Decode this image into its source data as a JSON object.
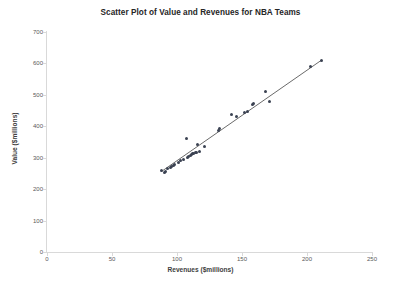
{
  "chart_data": {
    "type": "scatter",
    "title": "Scatter Plot of Value and Revenues for NBA Teams",
    "xlabel": "Revenues ($millions)",
    "ylabel": "Value ($millions)",
    "xlim": [
      0,
      250
    ],
    "ylim": [
      0,
      700
    ],
    "xticks": [
      0,
      50,
      100,
      150,
      200,
      250
    ],
    "yticks": [
      0,
      100,
      200,
      300,
      400,
      500,
      600,
      700
    ],
    "grid": false,
    "legend": false,
    "marker_color": "#3b4252",
    "trendline_color": "#595959",
    "trendline": {
      "visible": true,
      "x_start": 88,
      "y_start": 256,
      "x_end": 211,
      "y_end": 610
    },
    "points": [
      {
        "x": 88,
        "y": 258
      },
      {
        "x": 90,
        "y": 253
      },
      {
        "x": 91,
        "y": 256
      },
      {
        "x": 93,
        "y": 266
      },
      {
        "x": 95,
        "y": 268
      },
      {
        "x": 96,
        "y": 272
      },
      {
        "x": 97,
        "y": 275
      },
      {
        "x": 98,
        "y": 277
      },
      {
        "x": 101,
        "y": 285
      },
      {
        "x": 103,
        "y": 290
      },
      {
        "x": 105,
        "y": 294
      },
      {
        "x": 107,
        "y": 360
      },
      {
        "x": 108,
        "y": 302
      },
      {
        "x": 109,
        "y": 305
      },
      {
        "x": 110,
        "y": 308
      },
      {
        "x": 111,
        "y": 310
      },
      {
        "x": 112,
        "y": 312
      },
      {
        "x": 113,
        "y": 314
      },
      {
        "x": 114,
        "y": 316
      },
      {
        "x": 115,
        "y": 318
      },
      {
        "x": 116,
        "y": 341
      },
      {
        "x": 117,
        "y": 320
      },
      {
        "x": 121,
        "y": 336
      },
      {
        "x": 132,
        "y": 386
      },
      {
        "x": 133,
        "y": 392
      },
      {
        "x": 142,
        "y": 436
      },
      {
        "x": 146,
        "y": 430
      },
      {
        "x": 152,
        "y": 444
      },
      {
        "x": 154,
        "y": 448
      },
      {
        "x": 158,
        "y": 470
      },
      {
        "x": 159,
        "y": 472
      },
      {
        "x": 168,
        "y": 510
      },
      {
        "x": 171,
        "y": 478
      },
      {
        "x": 203,
        "y": 591
      },
      {
        "x": 211,
        "y": 610
      }
    ]
  }
}
